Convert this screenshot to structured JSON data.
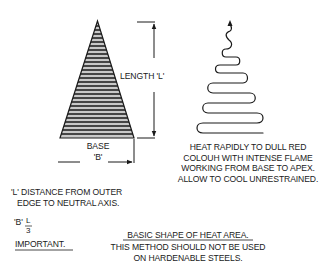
{
  "diagram": {
    "labels": {
      "length": "LENGTH 'L'",
      "base_line1": "BASE",
      "base_line2": "'B'",
      "instruction": [
        "HEAT RAPIDLY TO DULL RED",
        "COLOUH WITH INTENSE FLAME",
        "WORKING FROM BASE TO APEX.",
        "ALLOW TO COOL UNRESTRAINED."
      ],
      "definition": [
        "'L' DISTANCE FROM OUTER",
        "EDGE TO NEUTRAL AXIS."
      ],
      "formula_lhs": "'B'",
      "formula_num": "L",
      "formula_den": "3",
      "important": "IMPORTANT.",
      "caption": "BASIC SHAPE OF HEAT AREA.",
      "warning": [
        "THIS METHOD SHOULD NOT BE USED",
        "ON HARDENABLE STEELS."
      ]
    },
    "shapes": {
      "hatched_triangle": "heat area wedge with horizontal hatching",
      "serpentine_path": "heating torch path from base to apex",
      "dimension_arrows": [
        "length-arrow",
        "base-arrow"
      ]
    },
    "colors": {
      "ink": "#1a1a1a",
      "hatch_light": "#c8c8c8",
      "background": "#ffffff"
    }
  }
}
